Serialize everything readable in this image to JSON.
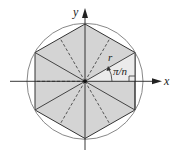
{
  "diagram": {
    "labels": {
      "x_axis": "x",
      "y_axis": "y",
      "radius": "r",
      "angle": "π/n"
    },
    "colors": {
      "polygon_fill": "#d4d4d4",
      "highlight_fill": "#ebebeb",
      "circle_stroke": "#888888",
      "line_stroke": "#333333",
      "axis_stroke": "#222222"
    }
  }
}
